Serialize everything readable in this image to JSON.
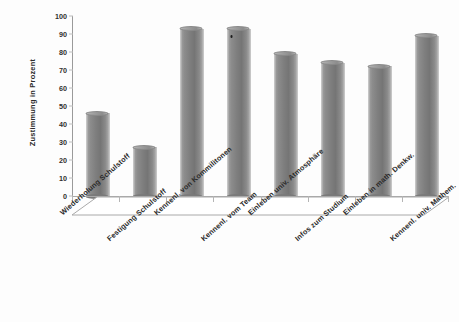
{
  "chart_data": {
    "type": "bar",
    "title": "",
    "subtitle": "",
    "xlabel": "",
    "ylabel": "Zustimmung in Prozent",
    "ylim": [
      0,
      100
    ],
    "ytick_step": 10,
    "yticks": [
      "100",
      "90",
      "80",
      "70",
      "60",
      "50",
      "40",
      "30",
      "20",
      "10",
      "0"
    ],
    "grid": false,
    "legend": null,
    "style": "3d-cylinder",
    "bar_color": "#808080",
    "categories": [
      "Wiederholung Schulstoff",
      "Festigung Schulstoff",
      "Kennenl. von Kommilitonen",
      "Kennenl. vom Team",
      "Einleben univ. Atmosphäre",
      "Infos zum Studium",
      "Einleben in math. Denkw.",
      "Kennenl. univ. Mathem."
    ],
    "values": [
      46,
      27,
      93,
      93,
      79,
      74,
      72,
      89
    ],
    "annotations": []
  },
  "axis": {
    "y_title": "Zustimmung in Prozent"
  },
  "colors": {
    "bar_light": "#a8a8a8",
    "bar_mid": "#8c8c8c",
    "bar_dark": "#757575",
    "axis": "#9a9a9a",
    "text": "#2b2b2b",
    "background": "#ffffff"
  }
}
